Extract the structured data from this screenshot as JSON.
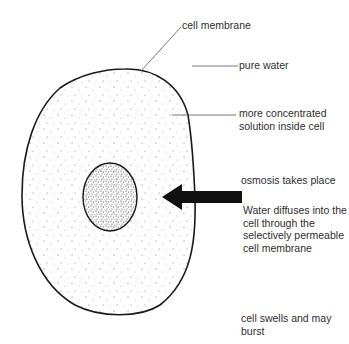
{
  "diagram": {
    "colors": {
      "outline": "#1a1a1a",
      "leader_line": "#555555",
      "arrow": "#111111",
      "stipple": "#444444",
      "text": "#2e2e2e"
    },
    "labels": {
      "cell_membrane": "cell membrane",
      "pure_water": "pure water",
      "concentrated_solution": [
        "more concentrated",
        "solution inside cell"
      ],
      "osmosis": "osmosis takes place",
      "water_diffuses": [
        "Water diffuses into the",
        "cell through the",
        "selectively permeable",
        "cell membrane"
      ],
      "cell_swells": [
        "cell swells and may",
        "burst"
      ]
    },
    "parts": {
      "cell": "cell-outline",
      "nucleus": "nucleus",
      "arrow": "water-movement-arrow"
    }
  }
}
